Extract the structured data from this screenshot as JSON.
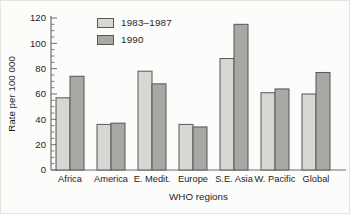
{
  "chart_data": {
    "type": "bar",
    "title": "",
    "xlabel": "WHO regions",
    "ylabel": "Rate per 100 000",
    "categories": [
      "Africa",
      "America",
      "E. Medit.",
      "Europe",
      "S.E. Asia",
      "W. Pacific",
      "Global"
    ],
    "series": [
      {
        "name": "1983–1987",
        "color": "#d7d7d4",
        "values": [
          57,
          36,
          78,
          36,
          88,
          61,
          60
        ]
      },
      {
        "name": "1990",
        "color": "#a8a8a5",
        "values": [
          74,
          37,
          68,
          34,
          115,
          64,
          77
        ]
      }
    ],
    "ylim": [
      0,
      120
    ],
    "yticks": [
      0,
      20,
      40,
      60,
      80,
      100,
      120
    ],
    "minor_tick_step": 5,
    "grid": false,
    "legend_position": "top-left-inside",
    "bar_border_color": "#57575a",
    "axis_color": "#6f6f6f",
    "text_color": "#1e1e1e"
  }
}
